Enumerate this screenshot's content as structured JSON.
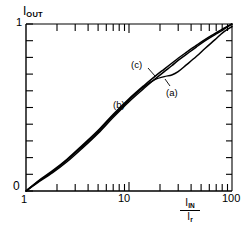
{
  "chart_data": {
    "type": "line",
    "title": "",
    "subtitle": "",
    "xlabel": "I_IN / I_r",
    "xlabel_numerator": "I",
    "xlabel_numerator_sub": "IN",
    "xlabel_denominator": "I",
    "xlabel_denominator_sub": "r",
    "ylabel": "I_OUT",
    "ylabel_main": "I",
    "ylabel_sub": "OUT",
    "xscale": "log",
    "yscale": "linear",
    "xlim": [
      1,
      100
    ],
    "ylim": [
      0,
      1
    ],
    "grid": false,
    "legend": "inline-annotations",
    "xticks": [
      1,
      2,
      3,
      4,
      5,
      6,
      7,
      8,
      9,
      10,
      20,
      30,
      40,
      50,
      60,
      70,
      80,
      90,
      100
    ],
    "xtick_labels": [
      {
        "value": 1,
        "label": "1"
      },
      {
        "value": 10,
        "label": "10"
      },
      {
        "value": 100,
        "label": "100"
      }
    ],
    "yticks": [
      0,
      0.1,
      0.2,
      0.3,
      0.4,
      0.5,
      0.6,
      0.7,
      0.8,
      0.9,
      1
    ],
    "ytick_labels": [
      {
        "value": 0,
        "label": "0"
      },
      {
        "value": 1,
        "label": "1"
      }
    ],
    "annotations": [
      {
        "text": "(a)",
        "x": 30,
        "y": 0.6
      },
      {
        "text": "(b)",
        "x": 13,
        "y": 0.52
      },
      {
        "text": "(c)",
        "x": 17,
        "y": 0.76
      }
    ],
    "series": [
      {
        "name": "(a)",
        "label": "(a)",
        "color": "#000000",
        "x": [
          1,
          1.3,
          1.8,
          2.5,
          3.5,
          5,
          7,
          10,
          14,
          18,
          22,
          26,
          30,
          36,
          45,
          55,
          68,
          82,
          100
        ],
        "y": [
          0.0,
          0.055,
          0.115,
          0.185,
          0.265,
          0.355,
          0.45,
          0.545,
          0.625,
          0.668,
          0.685,
          0.695,
          0.715,
          0.755,
          0.805,
          0.855,
          0.905,
          0.95,
          0.985
        ]
      },
      {
        "name": "(b)",
        "label": "(b)",
        "color": "#000000",
        "x": [
          1,
          1.3,
          1.8,
          2.5,
          3.5,
          5,
          7,
          10,
          14,
          18,
          22,
          26,
          30,
          36,
          45,
          55,
          68,
          82,
          100
        ],
        "y": [
          0.0,
          0.05,
          0.108,
          0.175,
          0.255,
          0.345,
          0.44,
          0.535,
          0.615,
          0.672,
          0.715,
          0.75,
          0.782,
          0.818,
          0.862,
          0.9,
          0.935,
          0.965,
          1.0
        ]
      },
      {
        "name": "(c)",
        "label": "(c)",
        "color": "#000000",
        "x": [
          1,
          1.3,
          1.8,
          2.5,
          3.5,
          5,
          7,
          10,
          14,
          18,
          22,
          26,
          30,
          36,
          45,
          55,
          68,
          82,
          100
        ],
        "y": [
          0.0,
          0.058,
          0.12,
          0.19,
          0.272,
          0.362,
          0.458,
          0.552,
          0.632,
          0.688,
          0.73,
          0.765,
          0.795,
          0.83,
          0.872,
          0.908,
          0.942,
          0.972,
          1.0
        ]
      }
    ]
  },
  "axes": {
    "y_axis_name": "I",
    "y_axis_name_sub": "OUT",
    "y_top_label": "1",
    "y_bottom_label": "0",
    "x_left_label": "1",
    "x_mid_label": "10",
    "x_right_label": "100"
  }
}
